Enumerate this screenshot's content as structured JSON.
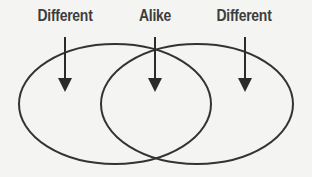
{
  "diagram": {
    "type": "venn",
    "labels": [
      {
        "id": "left",
        "text": "Different"
      },
      {
        "id": "middle",
        "text": "Alike"
      },
      {
        "id": "right",
        "text": "Different"
      }
    ],
    "sets": 2,
    "regions": [
      "left-only",
      "overlap",
      "right-only"
    ]
  }
}
